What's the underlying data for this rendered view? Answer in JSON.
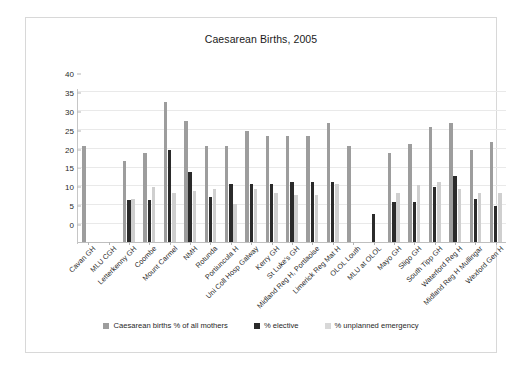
{
  "chart_data": {
    "type": "bar",
    "title": "Caesarean Births, 2005",
    "xlabel": "",
    "ylabel": "",
    "ylim": [
      0,
      40
    ],
    "yticks": [
      0,
      5,
      10,
      15,
      20,
      25,
      30,
      35,
      40
    ],
    "grid": true,
    "legend_position": "bottom",
    "categories": [
      "Cavan GH",
      "MLU CGH",
      "Letterkenny GH",
      "Coombe",
      "Mount Carmel",
      "NMH",
      "Rotunda",
      "Portiuncula H",
      "Uni Coll Hosp Galway",
      "Kerry GH",
      "St Luke's GH",
      "Midland Reg H, Portlaoise",
      "Limerick Reg Mat H",
      "OLOL Louth",
      "MLU at OLOL",
      "Mayo GH",
      "Sligo GH",
      "South Tipp GH",
      "Waterford Reg H",
      "Midland Reg H Mullingar",
      "Wexford Gen H"
    ],
    "series": [
      {
        "name": "Caesarean births % of all mothers",
        "color": "#9d9d9d",
        "values": [
          25.5,
          0,
          21.5,
          23.5,
          37,
          32,
          25.5,
          25.5,
          29.5,
          28,
          28,
          28,
          31.5,
          25.5,
          0,
          23.5,
          26,
          30.5,
          31.5,
          24.5,
          26.5
        ]
      },
      {
        "name": "% elective",
        "color": "#2b2b2b",
        "values": [
          0,
          0,
          11,
          11,
          24.5,
          18.5,
          12,
          15.5,
          15.5,
          15.5,
          16,
          16,
          16,
          0,
          7.5,
          10.5,
          10.5,
          14.5,
          17.5,
          11.5,
          9.5
        ]
      },
      {
        "name": "% unplanned emergency",
        "color": "#cfcfcf",
        "values": [
          0,
          0,
          11.5,
          14.5,
          13,
          13.5,
          14,
          10,
          14,
          13,
          12.5,
          12.5,
          15.5,
          0,
          0,
          13,
          15,
          16,
          14,
          13,
          13
        ]
      }
    ]
  },
  "legend": {
    "items": [
      {
        "label": "Caesarean births % of all mothers",
        "color": "#9d9d9d"
      },
      {
        "label": "% elective",
        "color": "#2b2b2b"
      },
      {
        "label": "% unplanned emergency",
        "color": "#d8d8d8"
      }
    ]
  }
}
